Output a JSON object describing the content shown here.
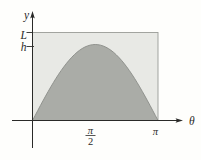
{
  "figure": {
    "y_axis_label": "y",
    "x_axis_label": "θ",
    "rect_height_label": "L",
    "curve_peak_label": "h",
    "x_tick_half_pi": {
      "numerator": "π",
      "denominator": "2"
    },
    "x_tick_pi": "π",
    "colors": {
      "background": "#fefefc",
      "rectangle_fill": "#e8e9e5",
      "region_fill": "#aaaca7",
      "rectangle_stroke": "#9a9c97",
      "curve_stroke": "#8a8c88",
      "axis_color": "#2a2a28",
      "label_color": "#2a2a28"
    }
  },
  "chart_data": {
    "type": "area",
    "title": "",
    "xlabel": "θ",
    "ylabel": "y",
    "x_domain_ticks": [
      "0",
      "π/2",
      "π"
    ],
    "y_marked_values": [
      "h",
      "L"
    ]
  }
}
